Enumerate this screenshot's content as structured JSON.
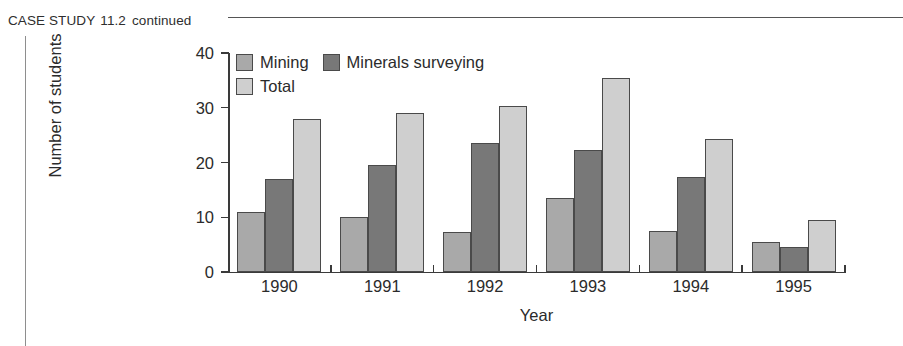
{
  "header": {
    "case_label": "CASE STUDY",
    "case_number": "11.2",
    "continued": "continued"
  },
  "chart_data": {
    "type": "bar",
    "title": "",
    "xlabel": "Year",
    "ylabel": "Number of students",
    "categories": [
      "1990",
      "1991",
      "1992",
      "1993",
      "1994",
      "1995"
    ],
    "series": [
      {
        "name": "Mining",
        "color": "#a9a9a9",
        "values": [
          11.0,
          10.0,
          7.3,
          13.5,
          7.5,
          5.5
        ]
      },
      {
        "name": "Minerals surveying",
        "color": "#787878",
        "values": [
          17.0,
          19.5,
          23.5,
          22.2,
          17.3,
          4.5
        ]
      },
      {
        "name": "Total",
        "color": "#cfcfcf",
        "values": [
          28.0,
          29.0,
          30.3,
          35.5,
          24.3,
          9.5
        ]
      }
    ],
    "ylim": [
      0,
      40
    ],
    "yticks": [
      0,
      10,
      20,
      30,
      40
    ],
    "ytick_labels": [
      "0",
      "10",
      "20",
      "30",
      "40"
    ],
    "grid": false,
    "legend_position": "top-left"
  },
  "colors": {
    "axis": "#3a3a3a",
    "bar_border": "#4a4a4a",
    "rule": "#555555",
    "text": "#2b2b2b"
  }
}
